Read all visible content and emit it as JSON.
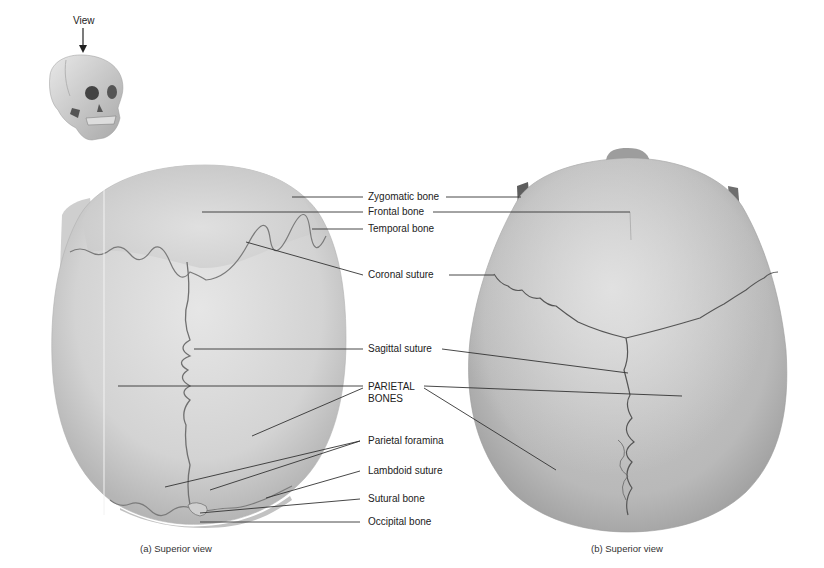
{
  "figure": {
    "orientation_icon": {
      "label": "View",
      "arrow": "down-arrow"
    },
    "left_panel": {
      "caption": "(a) Superior view"
    },
    "right_panel": {
      "caption": "(b) Superior view"
    },
    "labels": [
      {
        "id": "zygomatic",
        "text": "Zygomatic bone"
      },
      {
        "id": "frontal",
        "text": "Frontal bone"
      },
      {
        "id": "temporal",
        "text": "Temporal bone"
      },
      {
        "id": "coronal",
        "text": "Coronal suture"
      },
      {
        "id": "sagittal",
        "text": "Sagittal suture"
      },
      {
        "id": "parietal_1",
        "text": "PARIETAL"
      },
      {
        "id": "parietal_2",
        "text": "BONES"
      },
      {
        "id": "foramina",
        "text": "Parietal foramina"
      },
      {
        "id": "lambdoid",
        "text": "Lambdoid suture"
      },
      {
        "id": "sutural",
        "text": "Sutural bone"
      },
      {
        "id": "occipital",
        "text": "Occipital bone"
      }
    ],
    "colors": {
      "skull_a": "#d9d9d9",
      "skull_a_shade": "#bdbdbd",
      "skull_b": "#c4c4c4",
      "skull_b_shade": "#a8a8a8",
      "suture": "#6a6a6a",
      "leader": "#333333"
    }
  }
}
